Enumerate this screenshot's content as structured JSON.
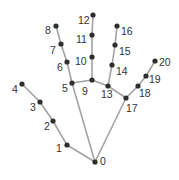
{
  "diagram": {
    "title": "",
    "colors": {
      "bone": "#a3a3a3",
      "joint": "#2e2e2e",
      "label": "#333333",
      "background": "#ffffff"
    },
    "landmarks": [
      {
        "id": 0,
        "label": "0",
        "x": 95,
        "y": 162,
        "lx": 100,
        "ly": 165
      },
      {
        "id": 1,
        "label": "1",
        "x": 67,
        "y": 145,
        "lx": 56,
        "ly": 152
      },
      {
        "id": 2,
        "label": "2",
        "x": 53,
        "y": 121,
        "lx": 44,
        "ly": 130
      },
      {
        "id": 3,
        "label": "3",
        "x": 40,
        "y": 102,
        "lx": 30,
        "ly": 111
      },
      {
        "id": 4,
        "label": "4",
        "x": 22,
        "y": 84,
        "lx": 12,
        "ly": 93
      },
      {
        "id": 5,
        "label": "5",
        "x": 72,
        "y": 83,
        "lx": 62,
        "ly": 92
      },
      {
        "id": 6,
        "label": "6",
        "x": 67,
        "y": 62,
        "lx": 57,
        "ly": 71
      },
      {
        "id": 7,
        "label": "7",
        "x": 61,
        "y": 44,
        "lx": 50,
        "ly": 54
      },
      {
        "id": 8,
        "label": "8",
        "x": 56,
        "y": 26,
        "lx": 45,
        "ly": 34
      },
      {
        "id": 9,
        "label": "9",
        "x": 92,
        "y": 80,
        "lx": 82,
        "ly": 95
      },
      {
        "id": 10,
        "label": "10",
        "x": 92,
        "y": 57,
        "lx": 75,
        "ly": 65
      },
      {
        "id": 11,
        "label": "11",
        "x": 92,
        "y": 35,
        "lx": 76,
        "ly": 43
      },
      {
        "id": 12,
        "label": "12",
        "x": 93,
        "y": 15,
        "lx": 78,
        "ly": 24
      },
      {
        "id": 13,
        "label": "13",
        "x": 108,
        "y": 86,
        "lx": 101,
        "ly": 98
      },
      {
        "id": 14,
        "label": "14",
        "x": 112,
        "y": 65,
        "lx": 116,
        "ly": 75
      },
      {
        "id": 15,
        "label": "15",
        "x": 115,
        "y": 45,
        "lx": 119,
        "ly": 55
      },
      {
        "id": 16,
        "label": "16",
        "x": 117,
        "y": 26,
        "lx": 121,
        "ly": 35
      },
      {
        "id": 17,
        "label": "17",
        "x": 126,
        "y": 98,
        "lx": 126,
        "ly": 112
      },
      {
        "id": 18,
        "label": "18",
        "x": 138,
        "y": 86,
        "lx": 139,
        "ly": 97
      },
      {
        "id": 19,
        "label": "19",
        "x": 146,
        "y": 76,
        "lx": 149,
        "ly": 83
      },
      {
        "id": 20,
        "label": "20",
        "x": 155,
        "y": 61,
        "lx": 159,
        "ly": 66
      }
    ],
    "connections": [
      [
        0,
        1
      ],
      [
        1,
        2
      ],
      [
        2,
        3
      ],
      [
        3,
        4
      ],
      [
        0,
        5
      ],
      [
        5,
        6
      ],
      [
        6,
        7
      ],
      [
        7,
        8
      ],
      [
        5,
        9
      ],
      [
        9,
        10
      ],
      [
        10,
        11
      ],
      [
        11,
        12
      ],
      [
        9,
        13
      ],
      [
        13,
        14
      ],
      [
        14,
        15
      ],
      [
        15,
        16
      ],
      [
        13,
        17
      ],
      [
        0,
        17
      ],
      [
        17,
        18
      ],
      [
        18,
        19
      ],
      [
        19,
        20
      ]
    ]
  }
}
